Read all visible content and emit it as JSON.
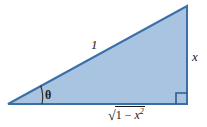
{
  "figure": {
    "name": "right-triangle-trig-substitution",
    "background_color": "#ffffff",
    "fill_color": "#a8c4e0",
    "stroke_color": "#3b6fa8",
    "text_color": "#1a1a1a",
    "width": 207,
    "height": 127
  },
  "labels": {
    "hypotenuse": "1",
    "opposite": "x",
    "angle": "θ",
    "adjacent_radical_sign": "√",
    "adjacent_radicand_prefix": "1 − ",
    "adjacent_radicand_var": "x",
    "adjacent_radicand_exponent": "2",
    "adjacent_full": "√(1 − x²)"
  },
  "geometry": {
    "vertex_left_apex": "8,104",
    "vertex_bottom_right": "187,104",
    "vertex_top_right": "187,6",
    "right_angle_marker_size": "11",
    "angle_arc_radius": "34"
  }
}
